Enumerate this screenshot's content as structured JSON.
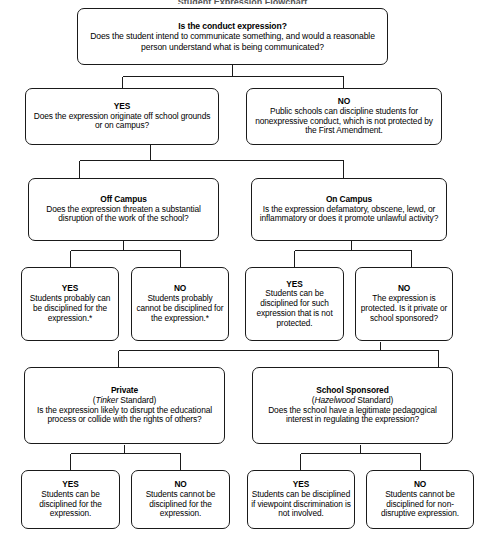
{
  "diagram": {
    "title_clipped": "Student Expression Flowchart",
    "nodes": {
      "q_conduct": {
        "heading": "Is the conduct expression?",
        "body": "Does the student intend to communicate something, and would a reasonable person understand what is being communicated?"
      },
      "yes_origin": {
        "heading": "YES",
        "body": "Does the expression originate off school grounds or on campus?"
      },
      "no_nonexpressive": {
        "heading": "NO",
        "body": "Public schools can discipline students for nonexpressive conduct, which is not protected by the First Amendment."
      },
      "off_campus": {
        "heading": "Off Campus",
        "body": "Does the expression threaten a substantial disruption of the work of the school?"
      },
      "on_campus": {
        "heading": "On Campus",
        "body": "Is the expression defamatory, obscene, lewd, or inflammatory or does it promote unlawful activity?"
      },
      "off_yes": {
        "heading": "YES",
        "body": "Students probably can be disciplined for the expression.*"
      },
      "off_no": {
        "heading": "NO",
        "body": "Students probably cannot be disciplined for the expression.*"
      },
      "on_yes": {
        "heading": "YES",
        "body": "Students can be disciplined for such expression that is not protected."
      },
      "on_no": {
        "heading": "NO",
        "body": "The expression is protected. Is it private or school sponsored?"
      },
      "private": {
        "heading": "Private",
        "sub_italic": "Tinker",
        "sub_rest": " Standard)",
        "sub_open": "(",
        "body": "Is the expression likely to disrupt the educational process or collide with the rights of others?"
      },
      "school_sponsored": {
        "heading": "School Sponsored",
        "sub_italic": "Hazelwood",
        "sub_rest": " Standard)",
        "sub_open": "(",
        "body": "Does the school have a legitimate pedagogical interest in regulating the expression?"
      },
      "private_yes": {
        "heading": "YES",
        "body": "Students can be disciplined for the expression."
      },
      "private_no": {
        "heading": "NO",
        "body": "Students cannot be disciplined for the expression."
      },
      "sponsored_yes": {
        "heading": "YES",
        "body": "Students can be disciplined if viewpoint discrimination is not involved."
      },
      "sponsored_no": {
        "heading": "NO",
        "body": "Students cannot be disciplined for non-disruptive expression."
      }
    }
  }
}
